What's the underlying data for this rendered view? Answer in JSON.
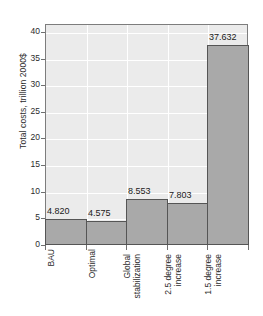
{
  "chart_data": {
    "type": "bar",
    "title": "",
    "subtitle": "",
    "xlabel": "",
    "ylabel": "Total costs, trillion 2000$",
    "categories": [
      "BAU",
      "Optimal",
      "Global\nstabilization",
      "2.5 degree\nincrease",
      "1.5 degree\nincrease"
    ],
    "values": [
      4.82,
      4.575,
      8.553,
      7.803,
      37.632
    ],
    "value_labels": [
      "4.820",
      "4.575",
      "8.553",
      "7.803",
      "37.632"
    ],
    "ylim": [
      0,
      41.5
    ],
    "yticks": [
      0,
      5,
      10,
      15,
      20,
      25,
      30,
      35,
      40
    ],
    "ytick_labels": [
      "0",
      "5",
      "10",
      "15",
      "20",
      "25",
      "30",
      "35",
      "40"
    ],
    "grid": true,
    "grid_color": "#ffffff",
    "legend": null,
    "legend_position": "none",
    "bar_color": "#a9a9a9",
    "bar_edge_color": "#555555",
    "plot_background": "#ebebeb",
    "figure_background": "#ffffff",
    "bar_gap": 0
  }
}
